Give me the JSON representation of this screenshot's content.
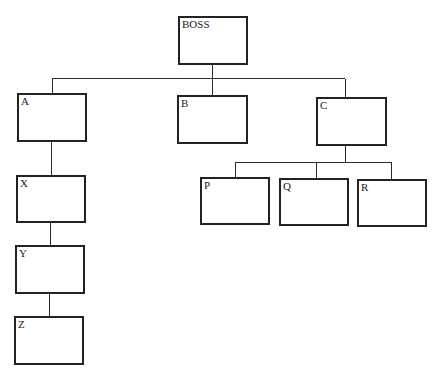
{
  "diagram": {
    "type": "org-chart",
    "nodes": {
      "boss": {
        "label": "BOSS"
      },
      "a": {
        "label": "A"
      },
      "b": {
        "label": "B"
      },
      "c": {
        "label": "C"
      },
      "x": {
        "label": "X"
      },
      "y": {
        "label": "Y"
      },
      "z": {
        "label": "Z"
      },
      "p": {
        "label": "P"
      },
      "q": {
        "label": "Q"
      },
      "r": {
        "label": "R"
      }
    },
    "edges": [
      [
        "BOSS",
        "A"
      ],
      [
        "BOSS",
        "B"
      ],
      [
        "BOSS",
        "C"
      ],
      [
        "A",
        "X"
      ],
      [
        "X",
        "Y"
      ],
      [
        "Y",
        "Z"
      ],
      [
        "C",
        "P"
      ],
      [
        "C",
        "Q"
      ],
      [
        "C",
        "R"
      ]
    ]
  }
}
